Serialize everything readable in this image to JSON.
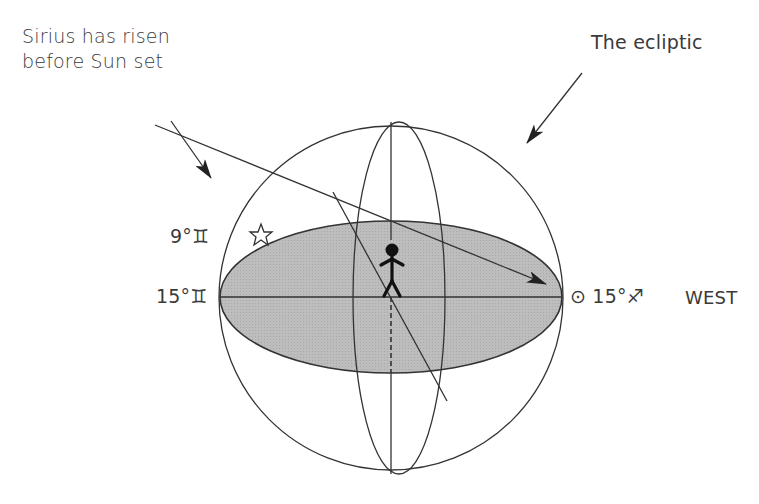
{
  "annotations": {
    "sirius_line1": "Sirius has risen",
    "sirius_line2": "before Sun set",
    "ecliptic": "The ecliptic"
  },
  "positions": {
    "gemini_9": "9°♊",
    "gemini_15": "15°♊",
    "sun_sagittarius": "⊙ 15°♐",
    "west": "WEST"
  },
  "symbols": {
    "star": "sirius-star-icon",
    "observer": "stick-figure-observer",
    "sun": "sun-symbol",
    "gemini": "gemini-glyph",
    "sagittarius": "sagittarius-glyph"
  },
  "colors": {
    "horizon_fill": "#b9b9b9",
    "stroke": "#333333",
    "background": "#ffffff"
  }
}
